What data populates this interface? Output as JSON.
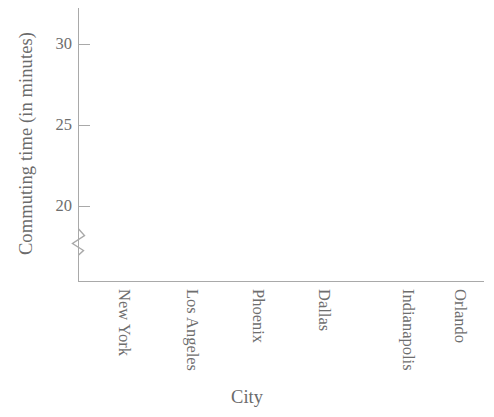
{
  "chart_data": {
    "type": "bar",
    "title": "",
    "subtitle": "",
    "xlabel": "City",
    "ylabel": "Commuting time (in minutes)",
    "categories": [
      "New York",
      "Los Angeles",
      "Phoenix",
      "Dallas",
      "Indianapolis",
      "Orlando"
    ],
    "values": [
      null,
      null,
      null,
      null,
      null,
      null
    ],
    "series": [],
    "yticks": [
      20,
      25,
      30
    ],
    "ytick_labels": [
      "20",
      "25",
      "30"
    ],
    "ylim": [
      17.8,
      31.7
    ],
    "axis_break": true,
    "axis_break_note": "zigzag break on y-axis below 20",
    "grid": false,
    "legend": null,
    "legend_position": "none",
    "data_plotted": false,
    "note": "Empty axes template: no bars, lines, or data markers are drawn.",
    "colors": {
      "axis": "#a9a9a9",
      "text": "#6e6e6e",
      "background": "#ffffff"
    }
  },
  "axis": {
    "y_title": "Commuting time (in minutes)",
    "x_title": "City",
    "ticks": [
      {
        "label": "30",
        "value": 30,
        "top": 44
      },
      {
        "label": "25",
        "value": 25,
        "top": 125
      },
      {
        "label": "20",
        "value": 20,
        "top": 206
      }
    ]
  },
  "categories": [
    {
      "label": "New York",
      "left": 134
    },
    {
      "label": "Los Angeles",
      "left": 202
    },
    {
      "label": "Phoenix",
      "left": 268
    },
    {
      "label": "Dallas",
      "left": 334
    },
    {
      "label": "Indianapolis",
      "left": 418
    },
    {
      "label": "Orlando",
      "left": 470
    }
  ]
}
